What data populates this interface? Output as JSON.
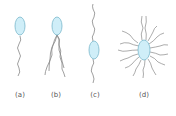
{
  "figure": {
    "panels": [
      {
        "label": "(a)",
        "type": "monotrichous",
        "x": 20
      },
      {
        "label": "(b)",
        "type": "lophotrichous",
        "x": 56
      },
      {
        "label": "(c)",
        "type": "amphitrichous",
        "x": 95
      },
      {
        "label": "(d)",
        "type": "peritrichous",
        "x": 144
      }
    ],
    "colors": {
      "cell_fill": "#cfeef8",
      "cell_stroke": "#7ab8cc",
      "flagella": "#888888",
      "label": "#555555"
    }
  }
}
